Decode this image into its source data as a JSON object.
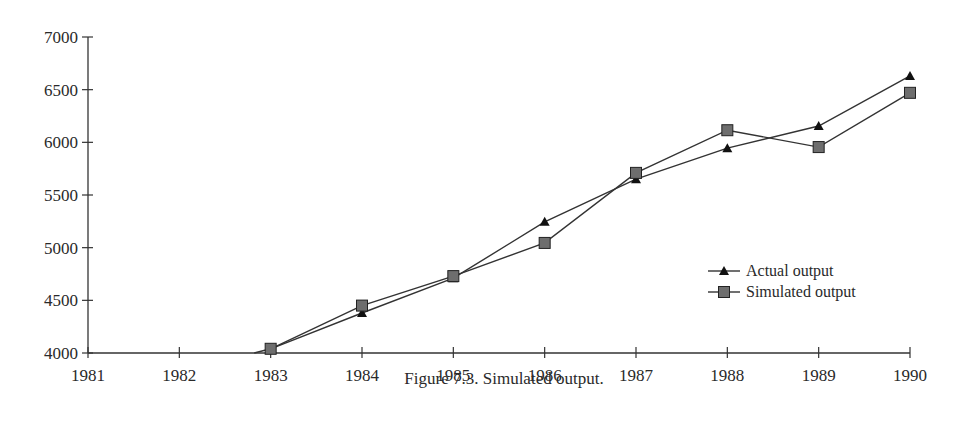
{
  "caption": "Figure 7.3.  Simulated output.",
  "chart_data": {
    "type": "line",
    "title": "",
    "xlabel": "",
    "ylabel": "",
    "x": [
      1983,
      1984,
      1985,
      1986,
      1987,
      1988,
      1989,
      1990
    ],
    "xticks": [
      "1981",
      "1982",
      "1983",
      "1984",
      "1985",
      "1986",
      "1987",
      "1988",
      "1989",
      "1990"
    ],
    "yticks": [
      "4000",
      "4500",
      "5000",
      "5500",
      "6000",
      "6500",
      "7000"
    ],
    "xlim": [
      1981,
      1990
    ],
    "ylim": [
      4000,
      7000
    ],
    "grid": false,
    "legend_position": "right, lower-middle inside plot",
    "series": [
      {
        "name": "Actual output",
        "marker": "triangle",
        "values": [
          4040,
          4380,
          4710,
          5245,
          5650,
          5945,
          6155,
          6630
        ],
        "note": "line enters from below the 4000 axis just before 1983"
      },
      {
        "name": "Simulated output",
        "marker": "square",
        "values": [
          4040,
          4450,
          4730,
          5045,
          5710,
          6115,
          5955,
          6470
        ]
      }
    ]
  },
  "colors": {
    "axis": "#333333",
    "line": "#333333",
    "triangle_marker": "#111111",
    "square_fill": "#6e6e6e",
    "square_stroke": "#222222"
  }
}
